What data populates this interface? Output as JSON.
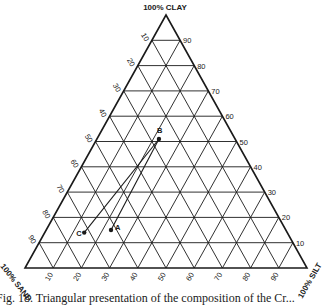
{
  "diagram": {
    "type": "ternary",
    "vertices": {
      "top": "100% CLAY",
      "bottom_left": "100% SAND",
      "bottom_right": "100% SILT"
    },
    "ticks": [
      10,
      20,
      30,
      40,
      50,
      60,
      70,
      80,
      90
    ],
    "left_axis_labels": [
      "10",
      "20",
      "30",
      "40",
      "50",
      "60",
      "70",
      "80",
      "90"
    ],
    "right_axis_labels": [
      "90",
      "80",
      "70",
      "60",
      "50",
      "40",
      "30",
      "20",
      "10"
    ],
    "bottom_axis_labels": [
      "10",
      "20",
      "30",
      "40",
      "50",
      "60",
      "70",
      "80",
      "90"
    ],
    "points": [
      {
        "label": "A",
        "sand": 62,
        "silt": 23,
        "clay": 15
      },
      {
        "label": "B",
        "sand": 27,
        "silt": 22,
        "clay": 51
      },
      {
        "label": "C",
        "sand": 72,
        "silt": 14,
        "clay": 14
      }
    ],
    "connectors": [
      {
        "from": "B",
        "to": "A"
      },
      {
        "from": "B",
        "to": "C"
      }
    ],
    "line_color": "#1a1a1a"
  },
  "caption": "Fig. 18.  Triangular presentation of the composition of the Cr..."
}
